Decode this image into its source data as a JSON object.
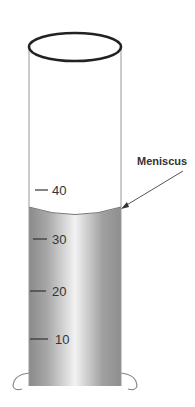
{
  "diagram": {
    "label": "Meniscus",
    "scale": [
      {
        "value": "40",
        "y": 190
      },
      {
        "value": "30",
        "y": 239
      },
      {
        "value": "20",
        "y": 291
      },
      {
        "value": "10",
        "y": 339
      }
    ],
    "colors": {
      "outline": "#222222",
      "wall": "#9a9a9a",
      "liquid_dark": "#8c8c8c",
      "liquid_light": "#f4f4f4",
      "text": "#333333"
    }
  }
}
